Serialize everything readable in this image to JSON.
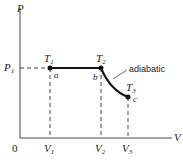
{
  "diagram": {
    "type": "PV diagram",
    "axes": {
      "x_label": "V",
      "y_label": "P",
      "origin_label": "0"
    },
    "pressure_label": {
      "base": "P",
      "sub": "1"
    },
    "points": [
      {
        "name": "a",
        "temp_base": "T",
        "temp_sub": "1",
        "volume_base": "V",
        "volume_sub": "1"
      },
      {
        "name": "b",
        "temp_base": "T",
        "temp_sub": "2",
        "volume_base": "V",
        "volume_sub": "2"
      },
      {
        "name": "c",
        "temp_base": "T",
        "temp_sub": "3",
        "volume_base": "V",
        "volume_sub": "3"
      }
    ],
    "curve_label": "adiabatic",
    "segments": [
      {
        "from": "a",
        "to": "b",
        "process": "isobaric"
      },
      {
        "from": "b",
        "to": "c",
        "process": "adiabatic"
      }
    ]
  }
}
